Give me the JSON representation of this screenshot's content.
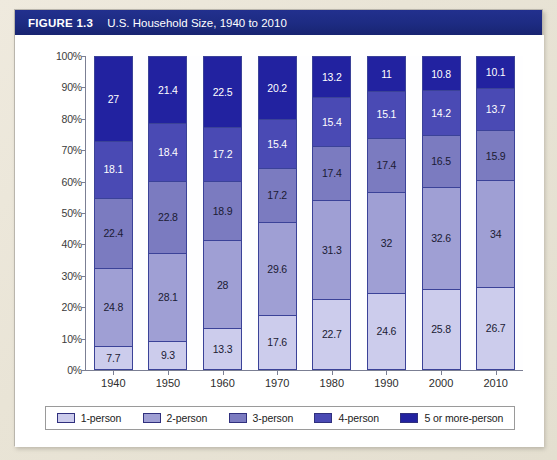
{
  "figure": {
    "number": "FIGURE 1.3",
    "title": "U.S. Household Size, 1940 to 2010"
  },
  "chart_data": {
    "type": "bar",
    "stacked": true,
    "stack_total": 100,
    "title": "U.S. Household Size, 1940 to 2010",
    "xlabel": "",
    "ylabel": "",
    "ylim": [
      0,
      100
    ],
    "ytick_labels": [
      "0%",
      "10%",
      "20%",
      "30%",
      "40%",
      "50%",
      "60%",
      "70%",
      "80%",
      "90%",
      "100%"
    ],
    "ytick_values": [
      0,
      10,
      20,
      30,
      40,
      50,
      60,
      70,
      80,
      90,
      100
    ],
    "grid": false,
    "legend_position": "bottom",
    "categories": [
      "1940",
      "1950",
      "1960",
      "1970",
      "1980",
      "1990",
      "2000",
      "2010"
    ],
    "series": [
      {
        "name": "1-person",
        "color": "#ccccec",
        "values": [
          7.7,
          9.3,
          13.3,
          17.6,
          22.7,
          24.6,
          25.8,
          26.7
        ],
        "labels": [
          "7.7",
          "9.3",
          "13.3",
          "17.6",
          "22.7",
          "24.6",
          "25.8",
          "26.7"
        ],
        "label_color": "#1a1a33"
      },
      {
        "name": "2-person",
        "color": "#9f9fd4",
        "values": [
          24.8,
          28.1,
          28.0,
          29.6,
          31.3,
          32.0,
          32.6,
          34.0
        ],
        "labels": [
          "24.8",
          "28.1",
          "28",
          "29.6",
          "31.3",
          "32",
          "32.6",
          "34"
        ],
        "label_color": "#1a1a33"
      },
      {
        "name": "3-person",
        "color": "#7b7bc0",
        "values": [
          22.4,
          22.8,
          18.9,
          17.2,
          17.4,
          17.4,
          16.5,
          15.9
        ],
        "labels": [
          "22.4",
          "22.8",
          "18.9",
          "17.2",
          "17.4",
          "17.4",
          "16.5",
          "15.9"
        ],
        "label_color": "#1a1a33"
      },
      {
        "name": "4-person",
        "color": "#4a4ab4",
        "values": [
          18.1,
          18.4,
          17.2,
          15.4,
          15.4,
          15.1,
          14.2,
          13.7
        ],
        "labels": [
          "18.1",
          "18.4",
          "17.2",
          "15.4",
          "15.4",
          "15.1",
          "14.2",
          "13.7"
        ],
        "label_color": "#ffffff"
      },
      {
        "name": "5 or more-person",
        "color": "#2222a0",
        "values": [
          27.0,
          21.4,
          22.5,
          20.2,
          13.2,
          11.0,
          10.8,
          10.1
        ],
        "labels": [
          "27",
          "21.4",
          "22.5",
          "20.2",
          "13.2",
          "11",
          "10.8",
          "10.1"
        ],
        "label_color": "#ffffff"
      }
    ]
  }
}
